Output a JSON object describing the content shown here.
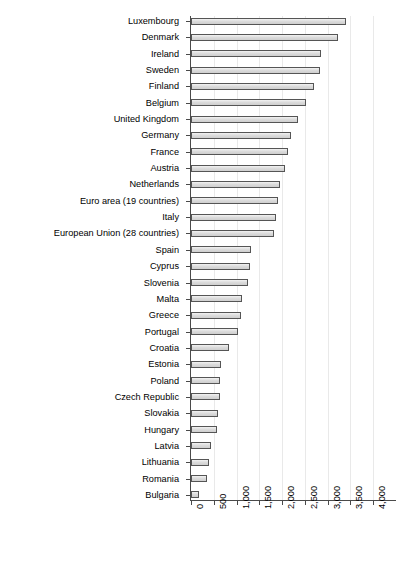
{
  "chart_data": {
    "type": "bar",
    "orientation": "horizontal",
    "title": "",
    "subtitle": "",
    "xlabel": "",
    "ylabel": "",
    "xlim": [
      0,
      4500
    ],
    "ylim": null,
    "grid": true,
    "gridlines_axis": "x",
    "legend": null,
    "legend_position": "none",
    "xticks": [
      0,
      500,
      1000,
      1500,
      2000,
      2500,
      3000,
      3500,
      4000,
      4500
    ],
    "xticklabels": [
      "0",
      "500",
      "1,000",
      "1,500",
      "2,000",
      "2,500",
      "3,000",
      "3,500",
      "4,000",
      "4,500"
    ],
    "xticklabel_rotation": -90,
    "categories": [
      "Luxembourg",
      "Denmark",
      "Ireland",
      "Sweden",
      "Finland",
      "Belgium",
      "United Kingdom",
      "Germany",
      "France",
      "Austria",
      "Netherlands",
      "Euro area (19 countries)",
      "Italy",
      "European Union (28 countries)",
      "Spain",
      "Cyprus",
      "Slovenia",
      "Malta",
      "Greece",
      "Portugal",
      "Croatia",
      "Estonia",
      "Poland",
      "Czech Republic",
      "Slovakia",
      "Hungary",
      "Latvia",
      "Lithuania",
      "Romania",
      "Bulgaria"
    ],
    "values": [
      3400,
      3220,
      2860,
      2830,
      2700,
      2530,
      2340,
      2200,
      2140,
      2060,
      1950,
      1900,
      1860,
      1830,
      1320,
      1290,
      1260,
      1130,
      1100,
      1040,
      830,
      650,
      640,
      630,
      600,
      560,
      440,
      400,
      350,
      170
    ],
    "bar_fill_color": "#dcdcdc",
    "bar_edge_color": "#555555",
    "gridline_color": "#e9e9e9",
    "axis_color": "#4a4a4a",
    "background_color": "#ffffff"
  }
}
